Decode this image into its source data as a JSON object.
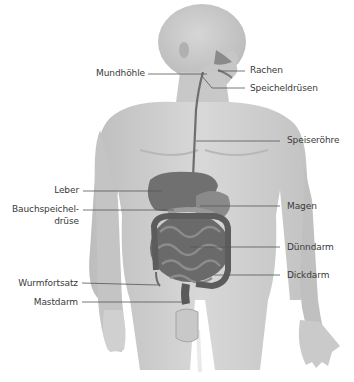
{
  "diagram": {
    "colors": {
      "background": "#ffffff",
      "body": "#cfcfcf",
      "body_dark": "#b5b5b5",
      "organs": "#7a7a7a",
      "organs_dark": "#5e5e5e",
      "leader_line": "#555555",
      "label_text": "#3a3a3a"
    },
    "labels_left": [
      {
        "id": "mundhoehle",
        "text": "Mundhöhle"
      },
      {
        "id": "leber",
        "text": "Leber"
      },
      {
        "id": "bauchspeicheldruese_1",
        "text": "Bauchspeichel-"
      },
      {
        "id": "bauchspeicheldruese_2",
        "text": "drüse"
      },
      {
        "id": "wurmfortsatz",
        "text": "Wurmfortsatz"
      },
      {
        "id": "mastdarm",
        "text": "Mastdarm"
      }
    ],
    "labels_right": [
      {
        "id": "rachen",
        "text": "Rachen"
      },
      {
        "id": "speicheldruesen",
        "text": "Speicheldrüsen"
      },
      {
        "id": "speiseroehre",
        "text": "Speiseröhre"
      },
      {
        "id": "magen",
        "text": "Magen"
      },
      {
        "id": "duenndarm",
        "text": "Dünndarm"
      },
      {
        "id": "dickdarm",
        "text": "Dickdarm"
      }
    ]
  }
}
